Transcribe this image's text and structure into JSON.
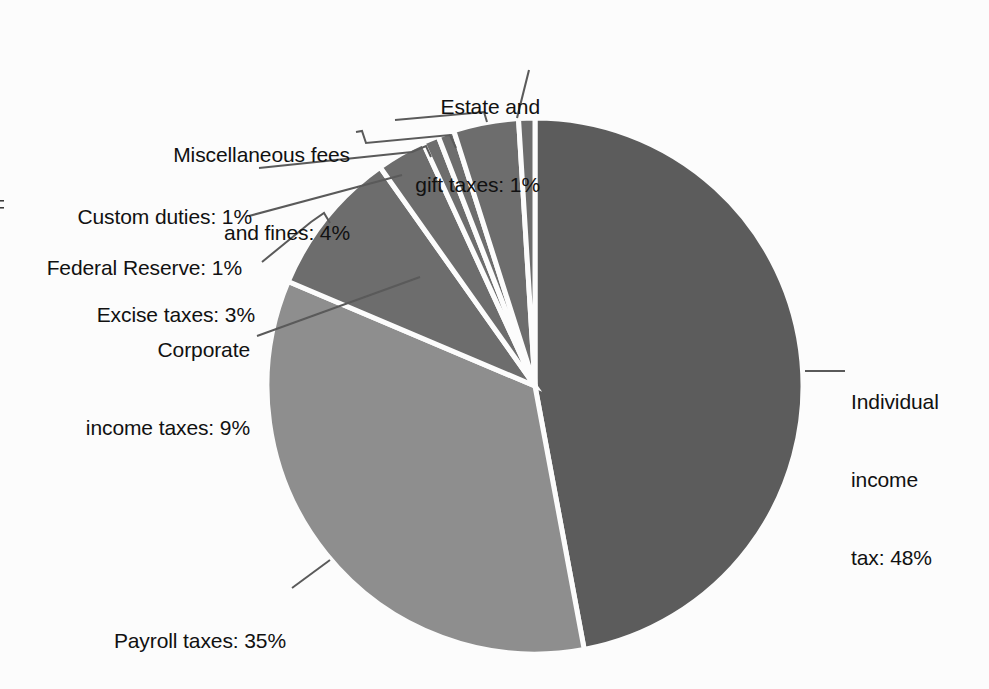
{
  "figure": {
    "background_color": "#fcfcfc",
    "text_color": "#111111",
    "leader_line_color": "#5a5a5a"
  },
  "chart_data": {
    "type": "pie",
    "title": "",
    "subtitle": "",
    "xlabel": "",
    "ylabel": "",
    "grid": false,
    "legend_position": "none",
    "label_style": "outside-with-leader-lines",
    "start_angle_deg": 0,
    "direction": "clockwise",
    "center": {
      "x": 535,
      "y": 386
    },
    "radius": 268,
    "categories": [
      "Individual income tax",
      "Payroll taxes",
      "Corporate income taxes",
      "Excise taxes",
      "Federal Reserve",
      "Custom duties",
      "Miscellaneous fees and fines",
      "Estate and gift taxes"
    ],
    "values": [
      48,
      35,
      9,
      3,
      1,
      1,
      4,
      1
    ],
    "value_unit": "%",
    "colors": [
      "#5c5c5c",
      "#8e8e8e",
      "#6d6d6d",
      "#6d6d6d",
      "#6d6d6d",
      "#6d6d6d",
      "#6d6d6d",
      "#6d6d6d"
    ],
    "slices": [
      {
        "name": "Individual income tax",
        "value": 48,
        "color": "#5c5c5c"
      },
      {
        "name": "Payroll taxes",
        "value": 35,
        "color": "#8e8e8e"
      },
      {
        "name": "Corporate income taxes",
        "value": 9,
        "color": "#6d6d6d"
      },
      {
        "name": "Excise taxes",
        "value": 3,
        "color": "#6d6d6d"
      },
      {
        "name": "Federal Reserve",
        "value": 1,
        "color": "#6d6d6d"
      },
      {
        "name": "Custom duties",
        "value": 1,
        "color": "#6d6d6d"
      },
      {
        "name": "Miscellaneous fees and fines",
        "value": 4,
        "color": "#6d6d6d"
      },
      {
        "name": "Estate and gift taxes",
        "value": 1,
        "color": "#6d6d6d"
      }
    ]
  },
  "labels": {
    "estate_gift": {
      "line1": "Estate and",
      "line2": "gift taxes: 1%"
    },
    "misc_fees": {
      "line1": "Miscellaneous fees",
      "line2": "and fines: 4%"
    },
    "custom_duties": {
      "line1": "Custom duties: 1%"
    },
    "federal_reserve": {
      "line1": "Federal Reserve: 1%"
    },
    "excise": {
      "line1": "Excise taxes: 3%"
    },
    "corporate": {
      "line1": "Corporate",
      "line2": "income taxes: 9%"
    },
    "payroll": {
      "line1": "Payroll taxes: 35%"
    },
    "individual": {
      "line1": "Individual",
      "line2": "income",
      "line3": "tax: 48%"
    },
    "edge_fragment": "F"
  }
}
